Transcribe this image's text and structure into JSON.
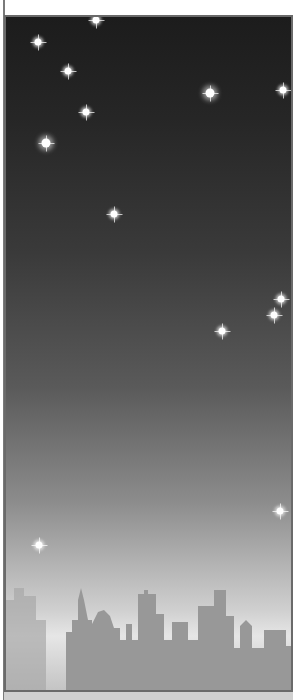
{
  "scene": {
    "description": "Night sky with stars over a city skyline",
    "colors": {
      "sky_top": "#1c1c1c",
      "sky_bottom": "#e6e6e6",
      "skyline": "#9a9a9a",
      "frame": "#6a6a6a"
    },
    "stars": [
      {
        "x": 36,
        "y": 40,
        "size": "small"
      },
      {
        "x": 66,
        "y": 69,
        "size": "small"
      },
      {
        "x": 94,
        "y": 18,
        "size": "small"
      },
      {
        "x": 84,
        "y": 110,
        "size": "small"
      },
      {
        "x": 44,
        "y": 141,
        "size": "big"
      },
      {
        "x": 208,
        "y": 91,
        "size": "big"
      },
      {
        "x": 281,
        "y": 88,
        "size": "small"
      },
      {
        "x": 112,
        "y": 212,
        "size": "small"
      },
      {
        "x": 279,
        "y": 297,
        "size": "small"
      },
      {
        "x": 272,
        "y": 313,
        "size": "small"
      },
      {
        "x": 220,
        "y": 329,
        "size": "small"
      },
      {
        "x": 278,
        "y": 509,
        "size": "small"
      },
      {
        "x": 37,
        "y": 543,
        "size": "small"
      }
    ]
  }
}
